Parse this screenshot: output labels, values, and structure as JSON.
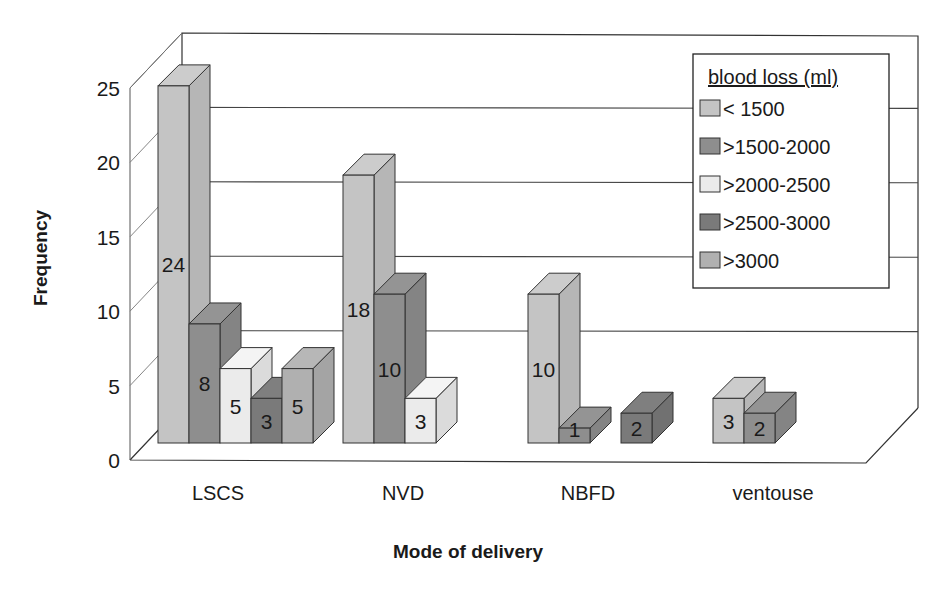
{
  "chart_data": {
    "type": "bar",
    "style": "3d-clustered-column",
    "title": "",
    "xlabel": "Mode of delivery",
    "ylabel": "Frequency",
    "ylim": [
      0,
      25
    ],
    "yticks": [
      0,
      5,
      10,
      15,
      20,
      25
    ],
    "grid": true,
    "legend_position": "upper-right-inside",
    "legend_title": "blood loss (ml)",
    "categories": [
      "LSCS",
      "NVD",
      "NBFD",
      "ventouse"
    ],
    "series": [
      {
        "name": "< 1500",
        "color": "#c4c4c4",
        "values": [
          24,
          18,
          10,
          3
        ]
      },
      {
        "name": ">1500-2000",
        "color": "#8e8e8e",
        "values": [
          8,
          10,
          1,
          2
        ]
      },
      {
        "name": ">2000-2500",
        "color": "#ebebeb",
        "values": [
          5,
          3,
          null,
          null
        ]
      },
      {
        "name": ">2500-3000",
        "color": "#7a7a7a",
        "values": [
          3,
          null,
          2,
          null
        ]
      },
      {
        "name": ">3000",
        "color": "#b0b0b0",
        "values": [
          5,
          null,
          null,
          null
        ]
      }
    ],
    "data_labels": true
  }
}
